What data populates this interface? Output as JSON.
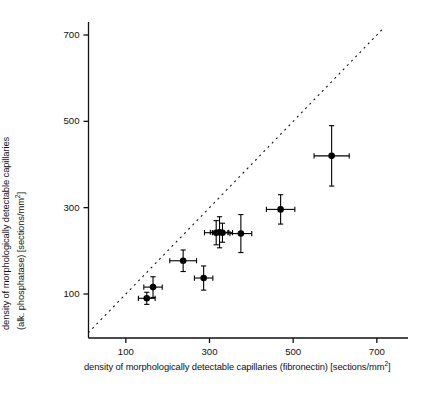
{
  "chart_data": {
    "type": "scatter",
    "title": "",
    "xlabel": "density of morphologically detectable capillaries (fibronectin) [sections/mm²]",
    "ylabel": "density of morphologically detectable capillaries (alk. phosphatase) [sections/mm²]",
    "xlabel_line1": "density of morphologically detectable capillaries (fibronectin)",
    "xlabel_line2_pre": "[sections/mm",
    "xlabel_line2_sup": "2",
    "xlabel_line2_post": "]",
    "ylabel_line1": "density of morphologically detectable capillaries",
    "ylabel_line2_pre": "(alk. phosphatase) [sections/mm",
    "ylabel_line2_sup": "2",
    "ylabel_line2_post": "]",
    "xlim": [
      0,
      760
    ],
    "ylim": [
      0,
      760
    ],
    "xticks": [
      100,
      300,
      500,
      700
    ],
    "yticks": [
      100,
      300,
      500,
      700
    ],
    "xtick_labels": [
      "100",
      "300",
      "500",
      "700"
    ],
    "ytick_labels": [
      "100",
      "300",
      "500",
      "700"
    ],
    "grid": false,
    "legend": "none",
    "marker": "filled-circle",
    "errorbars": "x and y",
    "reference_line": {
      "type": "dashed-identity-line",
      "label": "line of identity (y = x)",
      "x_start": 10,
      "y_start": 10,
      "x_end": 715,
      "y_end": 715,
      "dash": "2 4",
      "color": "#111111"
    },
    "points": [
      {
        "x": 150,
        "y": 90,
        "xerr": 20,
        "yerr": 14
      },
      {
        "x": 165,
        "y": 116,
        "xerr": 22,
        "yerr": 24
      },
      {
        "x": 237,
        "y": 177,
        "xerr": 32,
        "yerr": 25
      },
      {
        "x": 286,
        "y": 137,
        "xerr": 22,
        "yerr": 28
      },
      {
        "x": 316,
        "y": 242,
        "xerr": 28,
        "yerr": 28
      },
      {
        "x": 324,
        "y": 243,
        "xerr": 22,
        "yerr": 36
      },
      {
        "x": 331,
        "y": 242,
        "xerr": 24,
        "yerr": 22
      },
      {
        "x": 375,
        "y": 240,
        "xerr": 26,
        "yerr": 44
      },
      {
        "x": 470,
        "y": 296,
        "xerr": 34,
        "yerr": 34
      },
      {
        "x": 592,
        "y": 420,
        "xerr": 42,
        "yerr": 70
      }
    ],
    "axis_color": "#111111",
    "marker_color": "#000000"
  }
}
